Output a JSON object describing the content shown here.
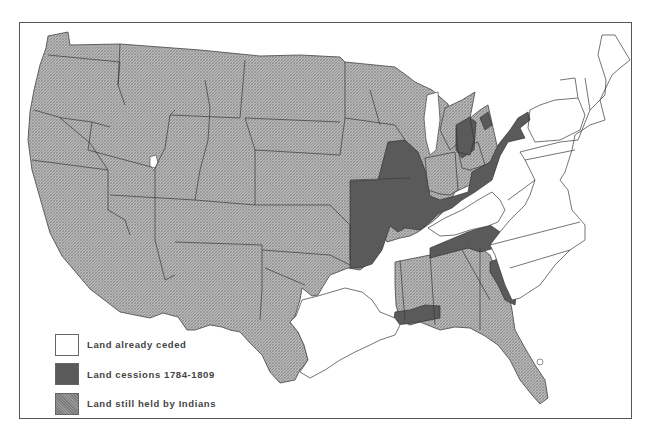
{
  "map": {
    "subject": "United States Indian land cessions 1784-1809",
    "colors": {
      "ceded": "#ffffff",
      "cessions": "#5a5a5a",
      "held": "#b4b4b4",
      "border": "#555555",
      "state_line": "#3a3a3a"
    }
  },
  "legend": {
    "items": [
      {
        "key": "ceded",
        "label": "Land already ceded"
      },
      {
        "key": "cessions",
        "label": "Land cessions 1784-1809"
      },
      {
        "key": "held",
        "label": "Land still held by Indians"
      }
    ]
  }
}
